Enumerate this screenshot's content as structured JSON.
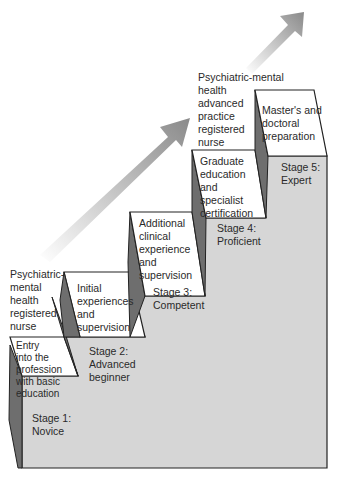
{
  "diagram": {
    "type": "staircase",
    "colors": {
      "step_face": "#ffffff",
      "step_body": "#d6d6d6",
      "step_side": "#6e6e6e",
      "outline": "#222222",
      "arrow": "#9a9a9a"
    },
    "roles": [
      {
        "id": "rn",
        "label": "Psychiatric-\nmental\nhealth\nregistered\nnurse"
      },
      {
        "id": "aprn",
        "label": "Psychiatric-mental\nhealth\nadvanced\npractice\nregistered\nnurse"
      }
    ],
    "steps": [
      {
        "stage": "Stage 1:\nNovice",
        "description": "Entry\ninto the\nprofession\nwith basic\neducation"
      },
      {
        "stage": "Stage 2:\nAdvanced\nbeginner",
        "description": "Initial\nexperiences\nand\nsupervision"
      },
      {
        "stage": "Stage 3:\nCompetent",
        "description": "Additional\nclinical\nexperience\nand\nsupervision"
      },
      {
        "stage": "Stage 4:\nProficient",
        "description": "Graduate\neducation\nand\nspecialist\ncertification"
      },
      {
        "stage": "Stage 5:\nExpert",
        "description": "Master's and\ndoctoral\npreparation"
      }
    ]
  }
}
